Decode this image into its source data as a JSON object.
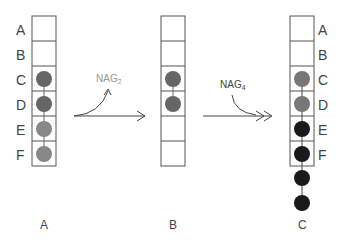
{
  "row_labels": [
    "A",
    "B",
    "C",
    "D",
    "E",
    "F"
  ],
  "columns": [
    {
      "id": "A",
      "label": "A",
      "x": 32,
      "cells": 6,
      "beads": [
        {
          "row": 2,
          "color": "#666666"
        },
        {
          "row": 3,
          "color": "#666666"
        },
        {
          "row": 4,
          "color": "#888888"
        },
        {
          "row": 5,
          "color": "#888888"
        }
      ],
      "extra_beads": 0,
      "row_labels_side": "left"
    },
    {
      "id": "B",
      "label": "B",
      "x": 161,
      "cells": 6,
      "beads": [
        {
          "row": 2,
          "color": "#666666"
        },
        {
          "row": 3,
          "color": "#666666"
        }
      ],
      "extra_beads": 0,
      "row_labels_side": "none"
    },
    {
      "id": "C",
      "label": "C",
      "x": 290,
      "cells": 6,
      "beads": [
        {
          "row": 2,
          "color": "#777777"
        },
        {
          "row": 3,
          "color": "#777777"
        },
        {
          "row": 4,
          "color": "#1a1a1a"
        },
        {
          "row": 5,
          "color": "#1a1a1a"
        }
      ],
      "extra_beads": 2,
      "extra_color": "#1a1a1a",
      "row_labels_side": "right"
    }
  ],
  "arrows": [
    {
      "id": "arrow-1",
      "label": "NAG",
      "subscript": "2",
      "label_color": "#999999"
    },
    {
      "id": "arrow-2",
      "label": "NAG",
      "subscript": "4",
      "label_color": "#444444"
    }
  ],
  "colors": {
    "grid": "#555555",
    "dark_bead": "#1a1a1a",
    "mid_bead": "#666666",
    "light_bead": "#888888"
  }
}
